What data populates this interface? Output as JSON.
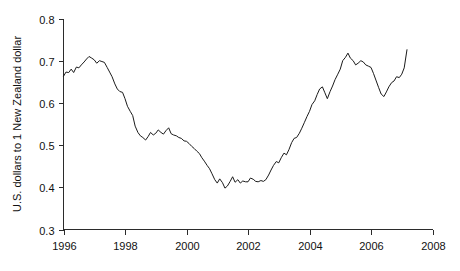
{
  "chart_data": {
    "type": "line",
    "title": "",
    "subtitle": "",
    "xlabel": "",
    "ylabel": "U.S. dollars to 1 New Zealand dollar",
    "xlim": [
      1996,
      2008
    ],
    "ylim": [
      0.3,
      0.8
    ],
    "grid": false,
    "legend": null,
    "legend_position": "none",
    "xticks": [
      1996,
      1998,
      2000,
      2002,
      2004,
      2006,
      2008
    ],
    "xtick_labels": [
      "1996",
      "1998",
      "2000",
      "2002",
      "2004",
      "2006",
      "2008"
    ],
    "yticks": [
      0.3,
      0.4,
      0.5,
      0.6,
      0.7,
      0.8
    ],
    "ytick_labels": [
      "0.3",
      "0.4",
      "0.5",
      "0.6",
      "0.7",
      "0.8"
    ],
    "line_color": "#1b1b1b",
    "series": [
      {
        "name": "USD per NZD",
        "x": [
          1996.0,
          1996.08,
          1996.17,
          1996.25,
          1996.33,
          1996.42,
          1996.5,
          1996.58,
          1996.67,
          1996.75,
          1996.83,
          1996.92,
          1997.0,
          1997.08,
          1997.17,
          1997.25,
          1997.33,
          1997.42,
          1997.5,
          1997.58,
          1997.67,
          1997.75,
          1997.83,
          1997.92,
          1998.0,
          1998.08,
          1998.17,
          1998.25,
          1998.33,
          1998.42,
          1998.5,
          1998.58,
          1998.67,
          1998.75,
          1998.83,
          1998.92,
          1999.0,
          1999.08,
          1999.17,
          1999.25,
          1999.33,
          1999.42,
          1999.5,
          1999.58,
          1999.67,
          1999.75,
          1999.83,
          1999.92,
          2000.0,
          2000.08,
          2000.17,
          2000.25,
          2000.33,
          2000.42,
          2000.5,
          2000.58,
          2000.67,
          2000.75,
          2000.83,
          2000.92,
          2001.0,
          2001.08,
          2001.17,
          2001.25,
          2001.33,
          2001.42,
          2001.5,
          2001.58,
          2001.67,
          2001.75,
          2001.83,
          2001.92,
          2002.0,
          2002.08,
          2002.17,
          2002.25,
          2002.33,
          2002.42,
          2002.5,
          2002.58,
          2002.67,
          2002.75,
          2002.83,
          2002.92,
          2003.0,
          2003.08,
          2003.17,
          2003.25,
          2003.33,
          2003.42,
          2003.5,
          2003.58,
          2003.67,
          2003.75,
          2003.83,
          2003.92,
          2004.0,
          2004.08,
          2004.17,
          2004.25,
          2004.33,
          2004.42,
          2004.5,
          2004.58,
          2004.67,
          2004.75,
          2004.83,
          2004.92,
          2005.0,
          2005.08,
          2005.17,
          2005.25,
          2005.33,
          2005.42,
          2005.5,
          2005.58,
          2005.67,
          2005.75,
          2005.83,
          2005.92,
          2006.0,
          2006.08,
          2006.17,
          2006.25,
          2006.33,
          2006.42,
          2006.5,
          2006.58,
          2006.67,
          2006.75,
          2006.83,
          2006.92,
          2007.0,
          2007.08,
          2007.17
        ],
        "values": [
          0.663,
          0.673,
          0.672,
          0.68,
          0.672,
          0.685,
          0.683,
          0.69,
          0.697,
          0.704,
          0.71,
          0.706,
          0.702,
          0.694,
          0.7,
          0.698,
          0.696,
          0.684,
          0.673,
          0.662,
          0.645,
          0.633,
          0.627,
          0.625,
          0.61,
          0.592,
          0.58,
          0.57,
          0.545,
          0.53,
          0.522,
          0.518,
          0.512,
          0.52,
          0.53,
          0.524,
          0.528,
          0.536,
          0.53,
          0.526,
          0.534,
          0.541,
          0.527,
          0.524,
          0.522,
          0.518,
          0.516,
          0.51,
          0.509,
          0.504,
          0.497,
          0.492,
          0.486,
          0.48,
          0.47,
          0.462,
          0.452,
          0.444,
          0.432,
          0.418,
          0.41,
          0.42,
          0.411,
          0.398,
          0.403,
          0.414,
          0.425,
          0.412,
          0.418,
          0.41,
          0.415,
          0.413,
          0.413,
          0.422,
          0.419,
          0.414,
          0.413,
          0.416,
          0.414,
          0.418,
          0.429,
          0.441,
          0.452,
          0.461,
          0.458,
          0.47,
          0.481,
          0.477,
          0.489,
          0.506,
          0.516,
          0.518,
          0.528,
          0.54,
          0.553,
          0.568,
          0.58,
          0.596,
          0.605,
          0.62,
          0.633,
          0.638,
          0.624,
          0.61,
          0.627,
          0.64,
          0.655,
          0.668,
          0.68,
          0.7,
          0.708,
          0.718,
          0.706,
          0.7,
          0.69,
          0.694,
          0.7,
          0.697,
          0.69,
          0.687,
          0.684,
          0.67,
          0.652,
          0.636,
          0.621,
          0.615,
          0.626,
          0.638,
          0.648,
          0.652,
          0.662,
          0.66,
          0.668,
          0.683,
          0.726
        ]
      }
    ]
  }
}
